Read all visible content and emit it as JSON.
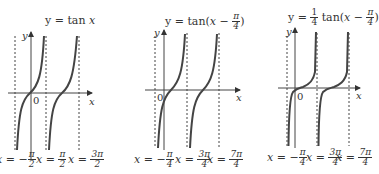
{
  "panels": [
    {
      "title": "y = tan x",
      "title_parts": {
        "prefix": "y = tan ",
        "var": "x"
      },
      "axis_labels": {
        "x": "x",
        "y": "y",
        "origin": "0"
      },
      "asymptotes": [
        {
          "label_prefix": "x = −",
          "num": "π",
          "den": "2"
        },
        {
          "label_prefix": "x = ",
          "num": "π",
          "den": "2"
        },
        {
          "label_prefix": "x = ",
          "num": "3π",
          "den": "2"
        }
      ]
    },
    {
      "title": "y = tan(x − π/4)",
      "title_parts": {
        "prefix": "y = tan(",
        "var": "x",
        "minus": " − ",
        "num": "π",
        "den": "4",
        "suffix": ")"
      },
      "axis_labels": {
        "x": "x",
        "y": "y",
        "origin": "0"
      },
      "asymptotes": [
        {
          "label_prefix": "x = −",
          "num": "π",
          "den": "4"
        },
        {
          "label_prefix": "x = ",
          "num": "3π",
          "den": "4"
        },
        {
          "label_prefix": "x = ",
          "num": "7π",
          "den": "4"
        }
      ]
    },
    {
      "title": "y = 1/4 tan(x − π/4)",
      "title_parts": {
        "prefix": "y = ",
        "coef_num": "1",
        "coef_den": "4",
        "mid": " tan(",
        "var": "x",
        "minus": " − ",
        "num": "π",
        "den": "4",
        "suffix": ")"
      },
      "axis_labels": {
        "x": "x",
        "y": "y",
        "origin": "0"
      },
      "asymptotes": [
        {
          "label_prefix": "x = −",
          "num": "π",
          "den": "4"
        },
        {
          "label_prefix": "x = ",
          "num": "3π",
          "den": "4"
        },
        {
          "label_prefix": "x = ",
          "num": "7π",
          "den": "4"
        }
      ]
    }
  ]
}
